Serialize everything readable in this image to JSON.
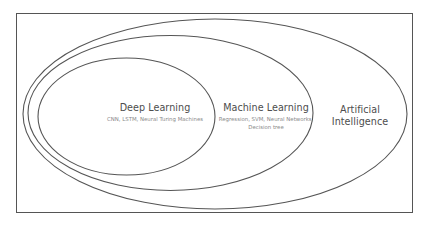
{
  "diagram": {
    "type": "nested-ellipses",
    "colors": {
      "stroke": "#555555",
      "title_text": "#4d4d4d",
      "subtitle_text": "#8a8a8a",
      "background": "#ffffff"
    },
    "sets": [
      {
        "id": "artificial-intelligence",
        "title": "Artificial Intelligence",
        "title_line1": "Artificial",
        "title_line2": "Intelligence",
        "subtitle": ""
      },
      {
        "id": "machine-learning",
        "title": "Machine Learning",
        "subtitle": "Regression, SVM, Neural Networks, Decision tree"
      },
      {
        "id": "deep-learning",
        "title": "Deep Learning",
        "subtitle": "CNN, LSTM, Neural Turing Machines"
      }
    ]
  }
}
